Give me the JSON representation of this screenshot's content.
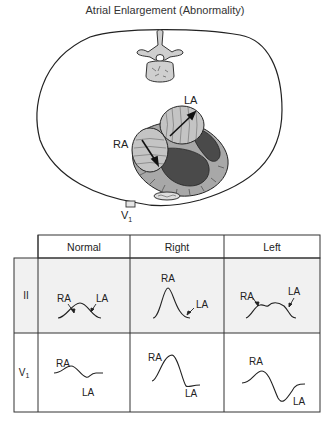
{
  "title": "Atrial Enlargement (Abnormality)",
  "anatomy": {
    "labels": {
      "right_atrium": "RA",
      "left_atrium": "LA",
      "electrode": "V",
      "electrode_sub": "1"
    }
  },
  "table": {
    "columns": [
      "Normal",
      "Right",
      "Left"
    ],
    "rows": [
      {
        "lead": "II",
        "lead_sub": "",
        "cells": [
          {
            "labels": [
              "RA",
              "LA"
            ]
          },
          {
            "labels": [
              "RA",
              "LA"
            ]
          },
          {
            "labels": [
              "RA",
              "LA"
            ]
          }
        ]
      },
      {
        "lead": "V",
        "lead_sub": "1",
        "cells": [
          {
            "labels": [
              "RA",
              "LA"
            ]
          },
          {
            "labels": [
              "RA",
              "LA"
            ]
          },
          {
            "labels": [
              "RA",
              "LA"
            ]
          }
        ]
      }
    ]
  },
  "colors": {
    "outline": "#222222",
    "grid": "#333333",
    "row_shade": "#f1f1f1",
    "heart_light": "#b8b8b8",
    "heart_dark": "#4a4a4a",
    "bone": "#c8c8c8"
  }
}
